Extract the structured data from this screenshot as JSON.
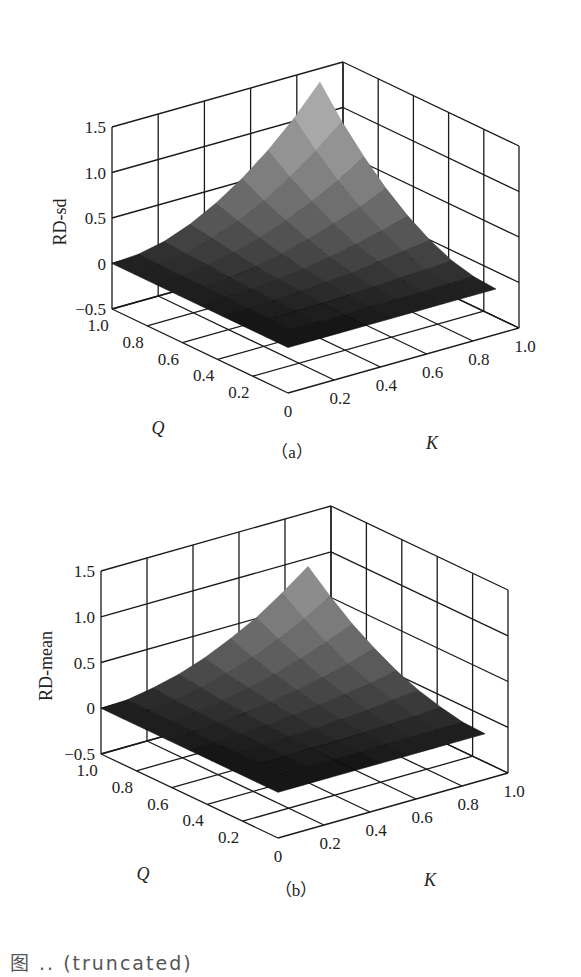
{
  "figure": {
    "bottom_caption_partial": "图 .. (truncated)"
  },
  "chart_data": [
    {
      "panel": "(a)",
      "type": "surface3d",
      "title": "",
      "caption": "（a）",
      "xlabel": "K",
      "ylabel": "Q",
      "zlabel": "RD-sd",
      "xlim": [
        0,
        1.0
      ],
      "ylim": [
        0,
        1.0
      ],
      "zlim": [
        -0.5,
        1.5
      ],
      "x_ticks": [
        "0.2",
        "0.4",
        "0.6",
        "0.8",
        "1.0"
      ],
      "y_ticks": [
        "0.2",
        "0.4",
        "0.6",
        "0.8",
        "1.0"
      ],
      "z_ticks": [
        "-0.5",
        "0",
        "0.5",
        "1.0",
        "1.5"
      ],
      "origin_label": "0",
      "grid": true,
      "colormap": "gray (height-shaded)",
      "K": [
        0,
        0.1125,
        0.225,
        0.3375,
        0.45,
        0.5625,
        0.675,
        0.7875,
        0.9
      ],
      "Q": [
        0,
        0.125,
        0.25,
        0.375,
        0.5,
        0.625,
        0.75,
        0.875,
        1.0
      ],
      "Z": [
        [
          0,
          0,
          0,
          0,
          0,
          0,
          0,
          0,
          0
        ],
        [
          0,
          0.0,
          0.0,
          0.0,
          0.01,
          0.01,
          0.01,
          0.02,
          0.02
        ],
        [
          0,
          0.0,
          0.01,
          0.01,
          0.02,
          0.03,
          0.05,
          0.06,
          0.08
        ],
        [
          0,
          0.0,
          0.01,
          0.03,
          0.05,
          0.07,
          0.11,
          0.15,
          0.19
        ],
        [
          0,
          0.01,
          0.02,
          0.05,
          0.08,
          0.13,
          0.19,
          0.26,
          0.34
        ],
        [
          0,
          0.01,
          0.03,
          0.07,
          0.13,
          0.21,
          0.3,
          0.4,
          0.53
        ],
        [
          0,
          0.01,
          0.05,
          0.11,
          0.19,
          0.3,
          0.43,
          0.58,
          0.76
        ],
        [
          0,
          0.02,
          0.06,
          0.15,
          0.26,
          0.4,
          0.58,
          0.79,
          1.03
        ],
        [
          0,
          0.02,
          0.08,
          0.19,
          0.34,
          0.53,
          0.76,
          1.03,
          1.35
        ]
      ]
    },
    {
      "panel": "(b)",
      "type": "surface3d",
      "title": "",
      "caption": "（b）",
      "xlabel": "K",
      "ylabel": "Q",
      "zlabel": "RD-mean",
      "xlim": [
        0,
        1.0
      ],
      "ylim": [
        0,
        1.0
      ],
      "zlim": [
        -0.5,
        1.5
      ],
      "x_ticks": [
        "0.2",
        "0.4",
        "0.6",
        "0.8",
        "1.0"
      ],
      "y_ticks": [
        "0.2",
        "0.4",
        "0.6",
        "0.8",
        "1.0"
      ],
      "z_ticks": [
        "-0.5",
        "0",
        "0.5",
        "1.0",
        "1.5"
      ],
      "origin_label": "0",
      "grid": true,
      "colormap": "gray (height-shaded)",
      "K": [
        0,
        0.1125,
        0.225,
        0.3375,
        0.45,
        0.5625,
        0.675,
        0.7875,
        0.9
      ],
      "Q": [
        0,
        0.125,
        0.25,
        0.375,
        0.5,
        0.625,
        0.75,
        0.875,
        1.0
      ],
      "Z": [
        [
          0,
          0,
          0,
          0,
          0,
          0,
          0,
          0,
          0
        ],
        [
          0,
          0.0,
          0.0,
          0.0,
          0.0,
          0.01,
          0.01,
          0.01,
          0.01
        ],
        [
          0,
          0.0,
          0.0,
          0.01,
          0.01,
          0.02,
          0.03,
          0.04,
          0.06
        ],
        [
          0,
          0.0,
          0.01,
          0.02,
          0.03,
          0.05,
          0.07,
          0.1,
          0.13
        ],
        [
          0,
          0.0,
          0.01,
          0.03,
          0.06,
          0.09,
          0.13,
          0.17,
          0.23
        ],
        [
          0,
          0.01,
          0.02,
          0.05,
          0.09,
          0.14,
          0.2,
          0.27,
          0.36
        ],
        [
          0,
          0.01,
          0.03,
          0.07,
          0.13,
          0.2,
          0.29,
          0.39,
          0.51
        ],
        [
          0,
          0.01,
          0.04,
          0.1,
          0.17,
          0.27,
          0.39,
          0.53,
          0.7
        ],
        [
          0,
          0.01,
          0.06,
          0.13,
          0.23,
          0.36,
          0.51,
          0.7,
          0.91
        ]
      ]
    }
  ]
}
